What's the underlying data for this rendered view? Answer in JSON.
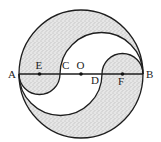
{
  "figure": {
    "type": "yin-yang style circle construction",
    "colors": {
      "stroke": "#1e1e1e",
      "shade_base": "#e4e4e4",
      "stipple_dot": "#8a8a8a",
      "background": "#ffffff"
    },
    "outer_circle": {
      "center_label": "O"
    },
    "diameter": {
      "from": "A",
      "to": "B"
    },
    "points": [
      {
        "id": "A",
        "label": "A",
        "marker": false
      },
      {
        "id": "E",
        "label": "E",
        "marker": true
      },
      {
        "id": "C",
        "label": "C",
        "marker": false
      },
      {
        "id": "O",
        "label": "O",
        "marker": true
      },
      {
        "id": "D",
        "label": "D",
        "marker": false
      },
      {
        "id": "F",
        "label": "F",
        "marker": true
      },
      {
        "id": "B",
        "label": "B",
        "marker": false
      }
    ],
    "semicircles": [
      {
        "diameter": "AC",
        "center": "E",
        "side": "below",
        "shaded": true
      },
      {
        "diameter": "DB",
        "center": "F",
        "side": "above",
        "shaded": true
      },
      {
        "diameter": "CB",
        "center": "midpoint of CB",
        "side": "above",
        "shaded": false
      },
      {
        "diameter": "AD",
        "center": "midpoint of AD",
        "side": "below",
        "shaded": false
      }
    ],
    "shaded_regions": [
      "upper region between outer circle and semicircle on CB",
      "inside semicircle on DB",
      "inside semicircle on AC",
      "lower region between outer circle and semicircle on AD"
    ]
  },
  "labels": {
    "A": "A",
    "B": "B",
    "C": "C",
    "D": "D",
    "E": "E",
    "F": "F",
    "O": "O"
  }
}
